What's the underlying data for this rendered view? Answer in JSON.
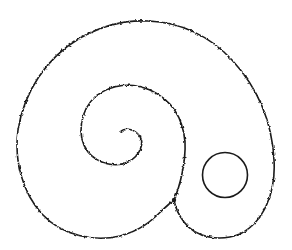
{
  "figure": {
    "colors": {
      "background": "#ffffff",
      "stroke": "#1a1a1a"
    },
    "stroke_width": 1.6,
    "shapes": {
      "outer_shell": {
        "path": "M 174 200 C 158 212, 150 228, 120 236 C 95 242, 62 236, 42 214 C 22 192, 14 160, 18 130 C 24 92, 46 58, 80 38 C 105 24, 130 20, 148 21 C 180 22, 210 36, 232 60 C 256 86, 272 120, 274 160 C 276 192, 264 222, 240 234 C 220 242, 196 238, 184 222 C 178 214, 175 206, 174 200 Z"
      },
      "inner_spiral": {
        "path": "M 174 200 C 180 186, 186 162, 185 142 C 183 118, 172 100, 150 90 C 132 82, 112 84, 96 96 C 80 110, 76 136, 88 152 C 98 164, 116 168, 128 162 C 140 156, 146 142, 138 134 C 132 128, 124 128, 120 132"
      },
      "circle": {
        "cx": 225,
        "cy": 175,
        "r": 22.5
      },
      "junction_dot": {
        "cx": 174,
        "cy": 200,
        "r": 2.2
      }
    }
  }
}
